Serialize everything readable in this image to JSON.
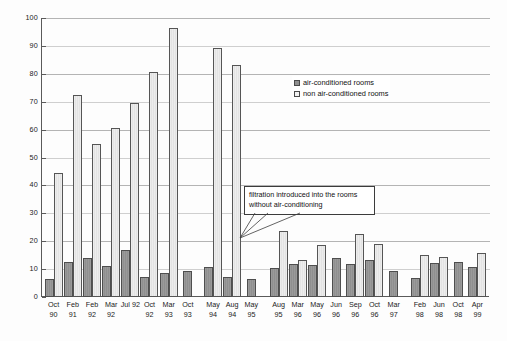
{
  "chart_data": {
    "type": "bar",
    "title": "",
    "subtitle": "",
    "xlabel": "",
    "ylabel": "",
    "ylim": [
      0,
      100
    ],
    "ytick_step": 10,
    "yticks": [
      0,
      10,
      20,
      30,
      40,
      50,
      60,
      70,
      80,
      90,
      100
    ],
    "grid": true,
    "legend_position": "upper-right",
    "categories": [
      "Oct 90",
      "Feb 91",
      "Feb 92",
      "Mar 92",
      "Jul 92",
      "Oct 92",
      "Mar 93",
      "Oct 93",
      "May 94",
      "Aug 94",
      "May 95",
      "Aug 95",
      "Mar 96",
      "May 96",
      "Jun 96",
      "Sep 96",
      "Oct 96",
      "Mar 97",
      "Feb 98",
      "Jun 98",
      "Oct 98",
      "Apr 99"
    ],
    "category_lines": [
      [
        "Oct",
        "90"
      ],
      [
        "Feb",
        "91"
      ],
      [
        "Feb",
        "92"
      ],
      [
        "Mar",
        "92"
      ],
      [
        "Jul 92",
        ""
      ],
      [
        "Oct",
        "92"
      ],
      [
        "Mar",
        "93"
      ],
      [
        "Oct",
        "93"
      ],
      [
        "May",
        "94"
      ],
      [
        "Aug",
        "94"
      ],
      [
        "May",
        "95"
      ],
      [
        "Aug",
        "95"
      ],
      [
        "Mar",
        "96"
      ],
      [
        "May",
        "96"
      ],
      [
        "Jun",
        "96"
      ],
      [
        "Sep",
        "96"
      ],
      [
        "Oct",
        "96"
      ],
      [
        "Mar",
        "97"
      ],
      [
        "Feb",
        "98"
      ],
      [
        "Jun",
        "98"
      ],
      [
        "Oct",
        "98"
      ],
      [
        "Apr",
        "99"
      ]
    ],
    "series": [
      {
        "name": "air-conditioned rooms",
        "color": "#8f8f8f",
        "values": [
          6.5,
          12.7,
          13.9,
          11.2,
          16.9,
          7.0,
          8.5,
          9.3,
          10.9,
          7.0,
          6.3,
          10.4,
          11.9,
          11.5,
          13.9,
          11.7,
          13.1,
          9.3,
          6.7,
          12.3,
          12.6,
          10.6
        ]
      },
      {
        "name": "non air-conditioned rooms",
        "color": "#e3e3e3",
        "values": [
          44.6,
          72.4,
          55.0,
          60.7,
          69.6,
          80.8,
          96.5,
          null,
          89.4,
          83.2,
          null,
          23.7,
          13.1,
          18.6,
          null,
          22.7,
          18.9,
          null,
          15.1,
          14.4,
          null,
          15.9
        ]
      }
    ],
    "annotations": [
      {
        "id": "filtration-note",
        "lines": [
          "filtration introduced into the rooms",
          "without air-conditioning"
        ]
      }
    ]
  },
  "legend": {
    "items": [
      {
        "label": "air-conditioned rooms",
        "swatch": "ac"
      },
      {
        "label": "non air-conditioned rooms",
        "swatch": "nac"
      }
    ]
  }
}
